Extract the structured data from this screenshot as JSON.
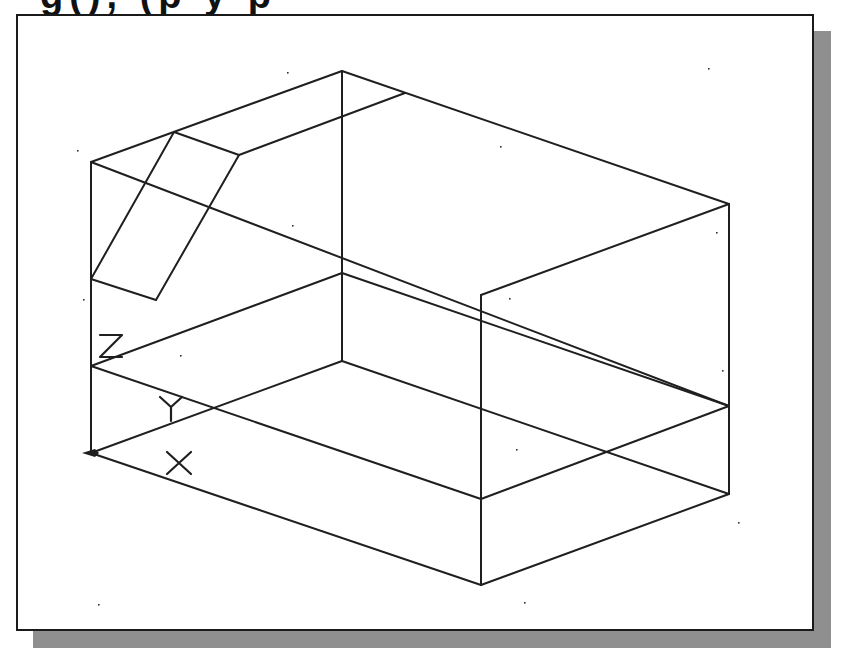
{
  "caption_fragment": "g(), (p y p",
  "viewport": {
    "frame": {
      "left": 16,
      "top": 14,
      "right": 814,
      "bottom": 631
    },
    "shadow": {
      "offset": 17,
      "color": "#8f8f8f"
    },
    "background": "#ffffff",
    "border_color": "#1a1a1a"
  },
  "drawing": {
    "stroke": "#1f1f1f",
    "stroke_width": 2,
    "edges": [
      {
        "name": "top-back-left-edge",
        "from": [
          91,
          162
        ],
        "to": [
          342,
          71
        ]
      },
      {
        "name": "top-back-right-edge",
        "from": [
          342,
          71
        ],
        "to": [
          729,
          204
        ]
      },
      {
        "name": "top-front-right-edge",
        "from": [
          729,
          204
        ],
        "to": [
          481,
          295
        ]
      },
      {
        "name": "top-front-left-diagonal",
        "from": [
          91,
          162
        ],
        "to": [
          729,
          406
        ]
      },
      {
        "name": "slot-top-edge",
        "from": [
          174,
          132
        ],
        "to": [
          239,
          155
        ]
      },
      {
        "name": "slot-left-edge",
        "from": [
          174,
          132
        ],
        "to": [
          91,
          279
        ]
      },
      {
        "name": "slot-right-edge",
        "from": [
          239,
          155
        ],
        "to": [
          156,
          300
        ]
      },
      {
        "name": "slot-bottom-edge",
        "from": [
          91,
          279
        ],
        "to": [
          156,
          300
        ]
      },
      {
        "name": "slot-back-edge",
        "from": [
          239,
          155
        ],
        "to": [
          405,
          93
        ]
      },
      {
        "name": "back-vertical-edge",
        "from": [
          342,
          71
        ],
        "to": [
          342,
          361
        ]
      },
      {
        "name": "left-vertical-edge",
        "from": [
          91,
          162
        ],
        "to": [
          91,
          453
        ]
      },
      {
        "name": "right-vertical-edge",
        "from": [
          729,
          204
        ],
        "to": [
          729,
          494
        ]
      },
      {
        "name": "front-vertical-edge",
        "from": [
          481,
          295
        ],
        "to": [
          481,
          585
        ]
      },
      {
        "name": "mid-back-left-edge",
        "from": [
          91,
          366
        ],
        "to": [
          342,
          273
        ]
      },
      {
        "name": "mid-back-right-edge",
        "from": [
          342,
          273
        ],
        "to": [
          729,
          406
        ]
      },
      {
        "name": "mid-front-left-edge",
        "from": [
          91,
          366
        ],
        "to": [
          481,
          499
        ]
      },
      {
        "name": "mid-front-right-edge",
        "from": [
          481,
          499
        ],
        "to": [
          729,
          406
        ]
      },
      {
        "name": "base-back-left-edge",
        "from": [
          91,
          453
        ],
        "to": [
          342,
          361
        ]
      },
      {
        "name": "base-back-right-edge",
        "from": [
          342,
          361
        ],
        "to": [
          729,
          494
        ]
      },
      {
        "name": "base-front-left-edge",
        "from": [
          91,
          453
        ],
        "to": [
          481,
          585
        ]
      },
      {
        "name": "base-front-right-edge",
        "from": [
          481,
          585
        ],
        "to": [
          729,
          494
        ]
      }
    ],
    "axis_labels": [
      {
        "name": "z-axis-label",
        "text": "Z",
        "x": 100,
        "y": 357
      },
      {
        "name": "y-axis-label",
        "text": "Y",
        "x": 160,
        "y": 419
      },
      {
        "name": "x-axis-label",
        "text": "X",
        "x": 167,
        "y": 474
      }
    ],
    "ucs_origin": {
      "x": 91,
      "y": 453
    },
    "grid_dots": [
      [
        77,
        150
      ],
      [
        287,
        72
      ],
      [
        708,
        68
      ],
      [
        500,
        146
      ],
      [
        292,
        225
      ],
      [
        716,
        232
      ],
      [
        83,
        299
      ],
      [
        509,
        298
      ],
      [
        722,
        370
      ],
      [
        516,
        449
      ],
      [
        738,
        522
      ],
      [
        98,
        604
      ],
      [
        524,
        602
      ],
      [
        180,
        355
      ]
    ]
  }
}
